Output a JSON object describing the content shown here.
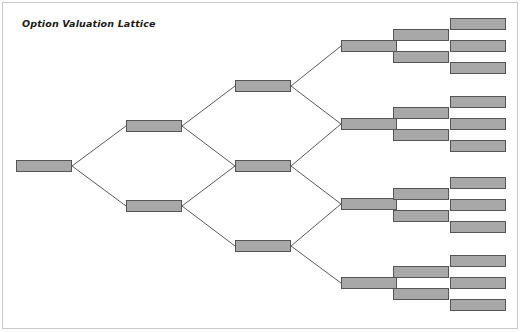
{
  "title": "Option Valuation Lattice",
  "colors": {
    "node_fill": "#a8a8a8",
    "node_border": "#555555",
    "edge_line": "#5a5a5a",
    "page_frame": "#c8c8c8",
    "background": "#ffffff",
    "title_text": "#1a1a1a"
  },
  "diagram": {
    "type": "recombining-binomial-lattice",
    "node_width_default": 56,
    "node_height_default": 12,
    "level_count": 6,
    "levels": [
      {
        "index": 1,
        "name": "root",
        "node_count": 1
      },
      {
        "index": 2,
        "name": "level-2",
        "node_count": 2
      },
      {
        "index": 3,
        "name": "level-3",
        "node_count": 3
      },
      {
        "index": 4,
        "name": "level-4",
        "node_count": 4
      },
      {
        "index": 5,
        "name": "level-5",
        "node_count": 8
      },
      {
        "index": 6,
        "name": "level-6",
        "node_count": 12
      }
    ],
    "nodes": [
      {
        "id": "n1-1",
        "level": 1,
        "x": 16,
        "y": 160,
        "w": 56,
        "h": 12
      },
      {
        "id": "n2-1",
        "level": 2,
        "x": 126,
        "y": 120,
        "w": 56,
        "h": 12
      },
      {
        "id": "n2-2",
        "level": 2,
        "x": 126,
        "y": 200,
        "w": 56,
        "h": 12
      },
      {
        "id": "n3-1",
        "level": 3,
        "x": 235,
        "y": 80,
        "w": 56,
        "h": 12
      },
      {
        "id": "n3-2",
        "level": 3,
        "x": 235,
        "y": 160,
        "w": 56,
        "h": 12
      },
      {
        "id": "n3-3",
        "level": 3,
        "x": 235,
        "y": 240,
        "w": 56,
        "h": 12
      },
      {
        "id": "n4-1",
        "level": 4,
        "x": 341,
        "y": 40,
        "w": 56,
        "h": 12
      },
      {
        "id": "n4-2",
        "level": 4,
        "x": 341,
        "y": 118,
        "w": 56,
        "h": 12
      },
      {
        "id": "n4-3",
        "level": 4,
        "x": 341,
        "y": 198,
        "w": 56,
        "h": 12
      },
      {
        "id": "n4-4",
        "level": 4,
        "x": 341,
        "y": 277,
        "w": 56,
        "h": 12
      },
      {
        "id": "n5-1",
        "level": 5,
        "x": 393,
        "y": 29,
        "w": 56,
        "h": 12
      },
      {
        "id": "n5-2",
        "level": 5,
        "x": 393,
        "y": 51,
        "w": 56,
        "h": 12
      },
      {
        "id": "n5-3",
        "level": 5,
        "x": 393,
        "y": 107,
        "w": 56,
        "h": 12
      },
      {
        "id": "n5-4",
        "level": 5,
        "x": 393,
        "y": 129,
        "w": 56,
        "h": 12
      },
      {
        "id": "n5-5",
        "level": 5,
        "x": 393,
        "y": 188,
        "w": 56,
        "h": 12
      },
      {
        "id": "n5-6",
        "level": 5,
        "x": 393,
        "y": 210,
        "w": 56,
        "h": 12
      },
      {
        "id": "n5-7",
        "level": 5,
        "x": 393,
        "y": 266,
        "w": 56,
        "h": 12
      },
      {
        "id": "n5-8",
        "level": 5,
        "x": 393,
        "y": 288,
        "w": 56,
        "h": 12
      },
      {
        "id": "n6-1",
        "level": 6,
        "x": 450,
        "y": 18,
        "w": 56,
        "h": 12
      },
      {
        "id": "n6-2",
        "level": 6,
        "x": 450,
        "y": 40,
        "w": 56,
        "h": 12
      },
      {
        "id": "n6-3",
        "level": 6,
        "x": 450,
        "y": 62,
        "w": 56,
        "h": 12
      },
      {
        "id": "n6-4",
        "level": 6,
        "x": 450,
        "y": 96,
        "w": 56,
        "h": 12
      },
      {
        "id": "n6-5",
        "level": 6,
        "x": 450,
        "y": 118,
        "w": 56,
        "h": 12
      },
      {
        "id": "n6-6",
        "level": 6,
        "x": 450,
        "y": 140,
        "w": 56,
        "h": 12
      },
      {
        "id": "n6-7",
        "level": 6,
        "x": 450,
        "y": 177,
        "w": 56,
        "h": 12
      },
      {
        "id": "n6-8",
        "level": 6,
        "x": 450,
        "y": 199,
        "w": 56,
        "h": 12
      },
      {
        "id": "n6-9",
        "level": 6,
        "x": 450,
        "y": 221,
        "w": 56,
        "h": 12
      },
      {
        "id": "n6-10",
        "level": 6,
        "x": 450,
        "y": 255,
        "w": 56,
        "h": 12
      },
      {
        "id": "n6-11",
        "level": 6,
        "x": 450,
        "y": 277,
        "w": 56,
        "h": 12
      },
      {
        "id": "n6-12",
        "level": 6,
        "x": 450,
        "y": 299,
        "w": 56,
        "h": 12
      }
    ],
    "edges": [
      {
        "from": "n1-1",
        "to": "n2-1",
        "x1": 72,
        "y1": 166,
        "x2": 126,
        "y2": 126
      },
      {
        "from": "n1-1",
        "to": "n2-2",
        "x1": 72,
        "y1": 166,
        "x2": 126,
        "y2": 206
      },
      {
        "from": "n2-1",
        "to": "n3-1",
        "x1": 182,
        "y1": 126,
        "x2": 235,
        "y2": 86
      },
      {
        "from": "n2-1",
        "to": "n3-2",
        "x1": 182,
        "y1": 126,
        "x2": 235,
        "y2": 166
      },
      {
        "from": "n2-2",
        "to": "n3-2",
        "x1": 182,
        "y1": 206,
        "x2": 235,
        "y2": 166
      },
      {
        "from": "n2-2",
        "to": "n3-3",
        "x1": 182,
        "y1": 206,
        "x2": 235,
        "y2": 246
      },
      {
        "from": "n3-1",
        "to": "n4-1",
        "x1": 291,
        "y1": 86,
        "x2": 341,
        "y2": 46
      },
      {
        "from": "n3-1",
        "to": "n4-2",
        "x1": 291,
        "y1": 86,
        "x2": 341,
        "y2": 124
      },
      {
        "from": "n3-2",
        "to": "n4-2",
        "x1": 291,
        "y1": 166,
        "x2": 341,
        "y2": 124
      },
      {
        "from": "n3-2",
        "to": "n4-3",
        "x1": 291,
        "y1": 166,
        "x2": 341,
        "y2": 204
      },
      {
        "from": "n3-3",
        "to": "n4-3",
        "x1": 291,
        "y1": 246,
        "x2": 341,
        "y2": 204
      },
      {
        "from": "n3-3",
        "to": "n4-4",
        "x1": 291,
        "y1": 246,
        "x2": 341,
        "y2": 283
      }
    ]
  }
}
